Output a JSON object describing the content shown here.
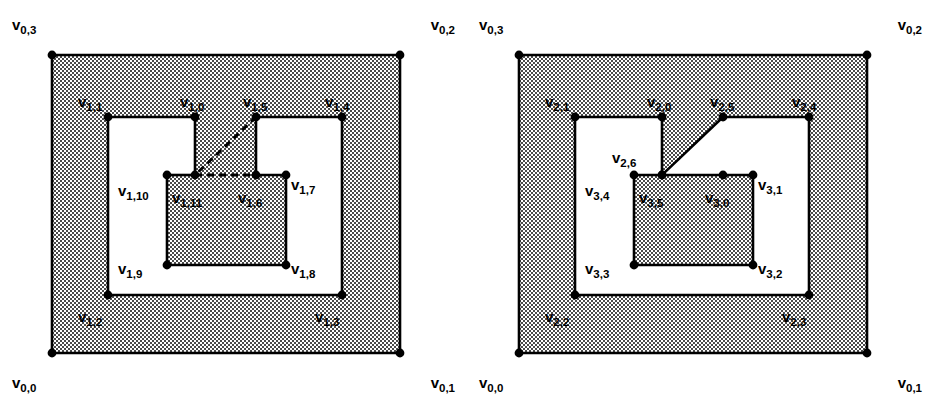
{
  "figure": {
    "name": "nested-polygon-hierarchy-figure",
    "width": 934,
    "height": 415,
    "background_color": "#ffffff",
    "line_color": "#000000",
    "vertex_color": "#000000",
    "shade_fill": "#b8b8b8",
    "hole_fill": "#ffffff",
    "panel_count": 2
  },
  "panels": [
    {
      "id": "left-panel",
      "name": "left-diagram",
      "outer_rect": {
        "x": 52,
        "y": 55,
        "w": 348,
        "h": 298
      },
      "labels": [
        {
          "id": "L-v03",
          "base": "v",
          "sub": "0,3",
          "x": 12,
          "y": 30,
          "anchor": "start"
        },
        {
          "id": "L-v02",
          "base": "v",
          "sub": "0,2",
          "x": 455,
          "y": 30,
          "anchor": "end"
        },
        {
          "id": "L-v00",
          "base": "v",
          "sub": "0,0",
          "x": 12,
          "y": 388,
          "anchor": "start"
        },
        {
          "id": "L-v01",
          "base": "v",
          "sub": "0,1",
          "x": 455,
          "y": 388,
          "anchor": "end"
        },
        {
          "id": "L-v11",
          "base": "v",
          "sub": "1,1",
          "x": 78,
          "y": 107,
          "anchor": "start"
        },
        {
          "id": "L-v10",
          "base": "v",
          "sub": "1,0",
          "x": 180,
          "y": 107,
          "anchor": "start"
        },
        {
          "id": "L-v15",
          "base": "v",
          "sub": "1,5",
          "x": 243,
          "y": 107,
          "anchor": "start"
        },
        {
          "id": "L-v14",
          "base": "v",
          "sub": "1,4",
          "x": 325,
          "y": 107,
          "anchor": "start"
        },
        {
          "id": "L-v110",
          "base": "v",
          "sub": "1,10",
          "x": 118,
          "y": 196,
          "anchor": "start"
        },
        {
          "id": "L-v111",
          "base": "v",
          "sub": "1,11",
          "x": 172,
          "y": 203,
          "anchor": "start"
        },
        {
          "id": "L-v16",
          "base": "v",
          "sub": "1,6",
          "x": 238,
          "y": 203,
          "anchor": "start"
        },
        {
          "id": "L-v17",
          "base": "v",
          "sub": "1,7",
          "x": 291,
          "y": 190,
          "anchor": "start"
        },
        {
          "id": "L-v19",
          "base": "v",
          "sub": "1,9",
          "x": 118,
          "y": 274,
          "anchor": "start"
        },
        {
          "id": "L-v18",
          "base": "v",
          "sub": "1,8",
          "x": 291,
          "y": 274,
          "anchor": "start"
        },
        {
          "id": "L-v12",
          "base": "v",
          "sub": "1,2",
          "x": 78,
          "y": 322,
          "anchor": "start"
        },
        {
          "id": "L-v13",
          "base": "v",
          "sub": "1,3",
          "x": 315,
          "y": 322,
          "anchor": "start"
        }
      ],
      "vertices": [
        {
          "id": "v0,0",
          "x": 52,
          "y": 353
        },
        {
          "id": "v0,1",
          "x": 400,
          "y": 353
        },
        {
          "id": "v0,2",
          "x": 400,
          "y": 55
        },
        {
          "id": "v0,3",
          "x": 52,
          "y": 55
        },
        {
          "id": "v1,0",
          "x": 195,
          "y": 117
        },
        {
          "id": "v1,1",
          "x": 108,
          "y": 117
        },
        {
          "id": "v1,2",
          "x": 108,
          "y": 295
        },
        {
          "id": "v1,3",
          "x": 342,
          "y": 295
        },
        {
          "id": "v1,4",
          "x": 342,
          "y": 117
        },
        {
          "id": "v1,5",
          "x": 256,
          "y": 117
        },
        {
          "id": "v1,6",
          "x": 256,
          "y": 175
        },
        {
          "id": "v1,7",
          "x": 286,
          "y": 175
        },
        {
          "id": "v1,8",
          "x": 286,
          "y": 265
        },
        {
          "id": "v1,9",
          "x": 167,
          "y": 265
        },
        {
          "id": "v1,10",
          "x": 167,
          "y": 175
        },
        {
          "id": "v1,11",
          "x": 195,
          "y": 175
        }
      ],
      "shaded_regions": [
        {
          "id": "L-outer-ring",
          "fill": "shade",
          "outline": [
            [
              52,
              55
            ],
            [
              400,
              55
            ],
            [
              400,
              353
            ],
            [
              52,
              353
            ]
          ],
          "holes": [
            [
              [
                108,
                117
              ],
              [
                195,
                117
              ],
              [
                195,
                175
              ],
              [
                167,
                175
              ],
              [
                167,
                265
              ],
              [
                286,
                265
              ],
              [
                286,
                175
              ],
              [
                256,
                175
              ],
              [
                256,
                117
              ],
              [
                342,
                117
              ],
              [
                342,
                295
              ],
              [
                108,
                295
              ]
            ]
          ]
        },
        {
          "id": "L-inner-block",
          "fill": "shade",
          "outline": [
            [
              167,
              175
            ],
            [
              286,
              175
            ],
            [
              286,
              265
            ],
            [
              167,
              265
            ]
          ],
          "holes": []
        },
        {
          "id": "L-connecting-strip",
          "fill": "shade",
          "outline": [
            [
              195,
              117
            ],
            [
              256,
              117
            ],
            [
              256,
              175
            ],
            [
              195,
              175
            ]
          ],
          "holes": []
        }
      ],
      "solid_edges": [
        [
          [
            52,
            55
          ],
          [
            400,
            55
          ]
        ],
        [
          [
            400,
            55
          ],
          [
            400,
            353
          ]
        ],
        [
          [
            400,
            353
          ],
          [
            52,
            353
          ]
        ],
        [
          [
            52,
            353
          ],
          [
            52,
            55
          ]
        ],
        [
          [
            108,
            117
          ],
          [
            195,
            117
          ]
        ],
        [
          [
            195,
            117
          ],
          [
            195,
            175
          ]
        ],
        [
          [
            256,
            117
          ],
          [
            256,
            175
          ]
        ],
        [
          [
            256,
            117
          ],
          [
            342,
            117
          ]
        ],
        [
          [
            342,
            117
          ],
          [
            342,
            295
          ]
        ],
        [
          [
            342,
            295
          ],
          [
            108,
            295
          ]
        ],
        [
          [
            108,
            295
          ],
          [
            108,
            117
          ]
        ],
        [
          [
            167,
            175
          ],
          [
            195,
            175
          ]
        ],
        [
          [
            256,
            175
          ],
          [
            286,
            175
          ]
        ],
        [
          [
            286,
            175
          ],
          [
            286,
            265
          ]
        ],
        [
          [
            286,
            265
          ],
          [
            167,
            265
          ]
        ],
        [
          [
            167,
            265
          ],
          [
            167,
            175
          ]
        ]
      ],
      "dashed_edges": [
        [
          [
            256,
            117
          ],
          [
            195,
            175
          ]
        ],
        [
          [
            195,
            175
          ],
          [
            256,
            175
          ]
        ]
      ]
    },
    {
      "id": "right-panel",
      "name": "right-diagram",
      "outer_rect": {
        "x": 52,
        "y": 55,
        "w": 348,
        "h": 298
      },
      "labels": [
        {
          "id": "R-v03",
          "base": "v",
          "sub": "0,3",
          "x": 12,
          "y": 30,
          "anchor": "start"
        },
        {
          "id": "R-v02",
          "base": "v",
          "sub": "0,2",
          "x": 455,
          "y": 30,
          "anchor": "end"
        },
        {
          "id": "R-v00",
          "base": "v",
          "sub": "0,0",
          "x": 12,
          "y": 388,
          "anchor": "start"
        },
        {
          "id": "R-v01",
          "base": "v",
          "sub": "0,1",
          "x": 455,
          "y": 388,
          "anchor": "end"
        },
        {
          "id": "R-v21",
          "base": "v",
          "sub": "2,1",
          "x": 78,
          "y": 107,
          "anchor": "start"
        },
        {
          "id": "R-v20",
          "base": "v",
          "sub": "2,0",
          "x": 180,
          "y": 107,
          "anchor": "start"
        },
        {
          "id": "R-v25",
          "base": "v",
          "sub": "2,5",
          "x": 243,
          "y": 107,
          "anchor": "start"
        },
        {
          "id": "R-v24",
          "base": "v",
          "sub": "2,4",
          "x": 325,
          "y": 107,
          "anchor": "start"
        },
        {
          "id": "R-v26",
          "base": "v",
          "sub": "2,6",
          "x": 145,
          "y": 163,
          "anchor": "start"
        },
        {
          "id": "R-v34",
          "base": "v",
          "sub": "3,4",
          "x": 118,
          "y": 196,
          "anchor": "start"
        },
        {
          "id": "R-v35",
          "base": "v",
          "sub": "3,5",
          "x": 172,
          "y": 203,
          "anchor": "start"
        },
        {
          "id": "R-v30",
          "base": "v",
          "sub": "3,0",
          "x": 238,
          "y": 203,
          "anchor": "start"
        },
        {
          "id": "R-v31",
          "base": "v",
          "sub": "3,1",
          "x": 291,
          "y": 190,
          "anchor": "start"
        },
        {
          "id": "R-v33",
          "base": "v",
          "sub": "3,3",
          "x": 118,
          "y": 274,
          "anchor": "start"
        },
        {
          "id": "R-v32",
          "base": "v",
          "sub": "3,2",
          "x": 291,
          "y": 274,
          "anchor": "start"
        },
        {
          "id": "R-v22",
          "base": "v",
          "sub": "2,2",
          "x": 78,
          "y": 322,
          "anchor": "start"
        },
        {
          "id": "R-v23",
          "base": "v",
          "sub": "2,3",
          "x": 315,
          "y": 322,
          "anchor": "start"
        }
      ],
      "vertices": [
        {
          "id": "v0,0",
          "x": 52,
          "y": 353
        },
        {
          "id": "v0,1",
          "x": 400,
          "y": 353
        },
        {
          "id": "v0,2",
          "x": 400,
          "y": 55
        },
        {
          "id": "v0,3",
          "x": 52,
          "y": 55
        },
        {
          "id": "v2,0",
          "x": 195,
          "y": 117
        },
        {
          "id": "v2,1",
          "x": 108,
          "y": 117
        },
        {
          "id": "v2,2",
          "x": 108,
          "y": 295
        },
        {
          "id": "v2,3",
          "x": 342,
          "y": 295
        },
        {
          "id": "v2,4",
          "x": 342,
          "y": 117
        },
        {
          "id": "v2,5",
          "x": 256,
          "y": 117
        },
        {
          "id": "v2,6",
          "x": 195,
          "y": 175
        },
        {
          "id": "v3,0",
          "x": 256,
          "y": 175
        },
        {
          "id": "v3,1",
          "x": 286,
          "y": 175
        },
        {
          "id": "v3,2",
          "x": 286,
          "y": 265
        },
        {
          "id": "v3,3",
          "x": 167,
          "y": 265
        },
        {
          "id": "v3,4",
          "x": 167,
          "y": 175
        },
        {
          "id": "v3,5",
          "x": 195,
          "y": 175
        }
      ],
      "shaded_regions": [
        {
          "id": "R-outer-ring",
          "fill": "shade",
          "outline": [
            [
              52,
              55
            ],
            [
              400,
              55
            ],
            [
              400,
              353
            ],
            [
              52,
              353
            ]
          ],
          "holes": [
            [
              [
                108,
                117
              ],
              [
                195,
                117
              ],
              [
                195,
                175
              ],
              [
                167,
                175
              ],
              [
                167,
                265
              ],
              [
                286,
                265
              ],
              [
                286,
                175
              ],
              [
                256,
                175
              ],
              [
                195,
                175
              ],
              [
                256,
                117
              ],
              [
                342,
                117
              ],
              [
                342,
                295
              ],
              [
                108,
                295
              ]
            ]
          ]
        },
        {
          "id": "R-inner-block",
          "fill": "shade",
          "outline": [
            [
              167,
              175
            ],
            [
              286,
              175
            ],
            [
              286,
              265
            ],
            [
              167,
              265
            ]
          ],
          "holes": []
        }
      ],
      "solid_edges": [
        [
          [
            52,
            55
          ],
          [
            400,
            55
          ]
        ],
        [
          [
            400,
            55
          ],
          [
            400,
            353
          ]
        ],
        [
          [
            400,
            353
          ],
          [
            52,
            353
          ]
        ],
        [
          [
            52,
            353
          ],
          [
            52,
            55
          ]
        ],
        [
          [
            108,
            117
          ],
          [
            195,
            117
          ]
        ],
        [
          [
            195,
            117
          ],
          [
            195,
            175
          ]
        ],
        [
          [
            256,
            117
          ],
          [
            195,
            175
          ]
        ],
        [
          [
            256,
            117
          ],
          [
            342,
            117
          ]
        ],
        [
          [
            342,
            117
          ],
          [
            342,
            295
          ]
        ],
        [
          [
            342,
            295
          ],
          [
            108,
            295
          ]
        ],
        [
          [
            108,
            295
          ],
          [
            108,
            117
          ]
        ],
        [
          [
            167,
            175
          ],
          [
            286,
            175
          ]
        ],
        [
          [
            286,
            175
          ],
          [
            286,
            265
          ]
        ],
        [
          [
            286,
            265
          ],
          [
            167,
            265
          ]
        ],
        [
          [
            167,
            265
          ],
          [
            167,
            175
          ]
        ]
      ],
      "dashed_edges": []
    }
  ]
}
